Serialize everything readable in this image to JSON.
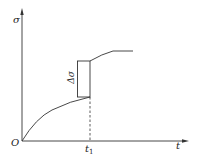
{
  "diagram": {
    "y_axis_label": "σ",
    "x_axis_label": "t",
    "origin_label": "O",
    "t1_label": "t",
    "t1_subscript": "1",
    "delta_label": "Δσ",
    "line_color": "#333333"
  }
}
